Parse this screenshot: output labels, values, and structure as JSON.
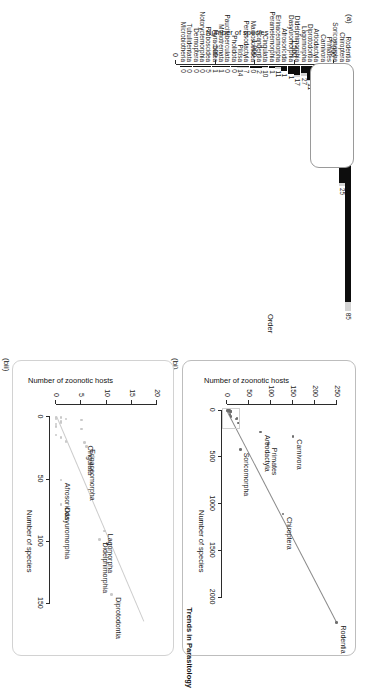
{
  "figure": {
    "journal_tag": "Trends in Parasitology",
    "panels": [
      {
        "tag": "(a)"
      },
      {
        "tag": "(bi)"
      },
      {
        "tag": "(bii)"
      }
    ]
  },
  "panel_a": {
    "tag": "(a)",
    "y_axis_title": "Number of species",
    "x_axis_title": "Order",
    "y_ticks": [
      "0",
      "500",
      "1,000",
      "1,500",
      "2,000"
    ]
  },
  "panel_bi": {
    "tag": "(bi)",
    "x_axis_title": "Number of species",
    "y_axis_title": "Number of zoonotic hosts",
    "x_ticks": [
      "0",
      "500",
      "1000",
      "1500",
      "2000"
    ],
    "y_ticks": [
      "0",
      "50",
      "100",
      "150",
      "200",
      "250"
    ]
  },
  "panel_bii": {
    "tag": "(bii)",
    "x_axis_title": "Number of species",
    "y_axis_title": "Number of zoonotic hosts",
    "x_ticks": [
      "0",
      "50",
      "100",
      "150"
    ],
    "y_ticks": [
      "0",
      "5",
      "10",
      "15",
      "20"
    ]
  },
  "chart_data": [
    {
      "type": "bar",
      "id": "panel-a",
      "title": "(a)",
      "xlabel": "Order",
      "ylabel": "Number of species",
      "ylim": [
        0,
        2200
      ],
      "grid": false,
      "orientation": "horizontal-stacked",
      "legend": null,
      "note": "Stacked bars: dark segment = non-zoonotic-host species, light segment = zoonotic host species. Light-segment counts shown as data labels.",
      "categories": [
        "Rodentia",
        "Chiroptera",
        "Soricomorpha",
        "Primates",
        "Carnivora",
        "Artiodactyla",
        "Diprotodontia",
        "Lagomorpha",
        "Didelphimorphia",
        "Dasyuromorphia",
        "Afrosoricida",
        "Erinaceomorpha",
        "Peramelemorphia",
        "Cingulata",
        "Scandentia",
        "Macroscelidea",
        "Perissodactyla",
        "Pilosa",
        "Pholidota",
        "Paucituberculata",
        "Monotremata",
        "Hyracoidea",
        "Proboscidea",
        "Notoryctemorphia",
        "Dermoptera",
        "Tubulidentata",
        "Microbiotheria"
      ],
      "series": [
        {
          "name": "Total species",
          "values": [
            2277,
            1116,
            428,
            376,
            286,
            240,
            143,
            92,
            99,
            71,
            51,
            24,
            21,
            21,
            20,
            15,
            17,
            10,
            8,
            6,
            5,
            4,
            3,
            2,
            2,
            1,
            1
          ]
        },
        {
          "name": "Zoonotic host species",
          "values": [
            85,
            25,
            21,
            61,
            83,
            52,
            11,
            27,
            17,
            1,
            1,
            11,
            1,
            10,
            2,
            0,
            7,
            14,
            0,
            0,
            1,
            1,
            5,
            0,
            0,
            0,
            0
          ]
        }
      ],
      "data_labels": [
        "85",
        "25",
        "21",
        "61",
        "83",
        "52",
        "11",
        "27",
        "17",
        "1",
        "1",
        "11",
        "1",
        "10",
        "2",
        "0",
        "7",
        "14",
        "0",
        "0",
        "1",
        "1",
        "5",
        "0",
        "0",
        "0",
        "0"
      ],
      "ytick_labels": [
        "0",
        "500",
        "1,000",
        "1,500",
        "2,000"
      ],
      "ytick_values": [
        0,
        500,
        1000,
        1500,
        2000
      ]
    },
    {
      "type": "scatter",
      "id": "panel-bi",
      "title": "(bi)",
      "xlabel": "Number of species",
      "ylabel": "Number of zoonotic hosts",
      "xlim": [
        -60,
        2400
      ],
      "ylim": [
        -12,
        262
      ],
      "grid": false,
      "xtick_values": [
        0,
        500,
        1000,
        1500,
        2000
      ],
      "ytick_values": [
        0,
        50,
        100,
        150,
        200,
        250
      ],
      "trend_line": {
        "type": "linear-fit",
        "x0": 0,
        "y0": 0,
        "x1": 2277,
        "y1": 252
      },
      "points": [
        {
          "label": "Rodentia",
          "x": 2277,
          "y": 250
        },
        {
          "label": "Chiroptera",
          "x": 1116,
          "y": 127
        },
        {
          "label": "Carnivora",
          "x": 286,
          "y": 150
        },
        {
          "label": "Primates",
          "x": 376,
          "y": 93
        },
        {
          "label": "Artiodactyla",
          "x": 240,
          "y": 76
        },
        {
          "label": "Soricomorpha",
          "x": 428,
          "y": 30
        },
        {
          "label": "",
          "x": 143,
          "y": 26
        },
        {
          "label": "",
          "x": 99,
          "y": 20
        },
        {
          "label": "",
          "x": 92,
          "y": 22
        },
        {
          "label": "",
          "x": 71,
          "y": 9
        },
        {
          "label": "",
          "x": 51,
          "y": 6
        },
        {
          "label": "",
          "x": 24,
          "y": 9
        },
        {
          "label": "",
          "x": 21,
          "y": 8
        },
        {
          "label": "",
          "x": 20,
          "y": 4
        },
        {
          "label": "",
          "x": 17,
          "y": 7
        },
        {
          "label": "",
          "x": 15,
          "y": 2
        },
        {
          "label": "",
          "x": 10,
          "y": 5
        },
        {
          "label": "",
          "x": 8,
          "y": 1
        },
        {
          "label": "",
          "x": 5,
          "y": 2
        },
        {
          "label": "",
          "x": 3,
          "y": 3
        }
      ],
      "inset_marker": "grey rectangle around the low-species cluster, expanded in panel (bii)"
    },
    {
      "type": "scatter",
      "id": "panel-bii",
      "title": "(bii)",
      "xlabel": "Number of species",
      "ylabel": "Number of zoonotic hosts",
      "xlim": [
        -10,
        175
      ],
      "ylim": [
        -1.2,
        21
      ],
      "grid": false,
      "xtick_values": [
        0,
        50,
        100,
        150
      ],
      "ytick_values": [
        0,
        5,
        10,
        15,
        20
      ],
      "trend_line": {
        "type": "linear-fit",
        "x0": 0,
        "y0": 0.2,
        "x1": 165,
        "y1": 17.5
      },
      "points": [
        {
          "label": "Diprotodontia",
          "x": 143,
          "y": 11
        },
        {
          "label": "Lagomorpha",
          "x": 92,
          "y": 9.6
        },
        {
          "label": "Didelphimorphia",
          "x": 99,
          "y": 8.6
        },
        {
          "label": "Dasyuromorphia",
          "x": 71,
          "y": 1
        },
        {
          "label": "Afrosoricida",
          "x": 51,
          "y": 1
        },
        {
          "label": "Erinaceomorpha",
          "x": 24,
          "y": 6
        },
        {
          "label": "Cingulata",
          "x": 21,
          "y": 5.6
        },
        {
          "label": "",
          "x": 20,
          "y": 2
        },
        {
          "label": "",
          "x": 17,
          "y": 1
        },
        {
          "label": "",
          "x": 15,
          "y": 0
        },
        {
          "label": "",
          "x": 10,
          "y": 5
        },
        {
          "label": "",
          "x": 8,
          "y": 0
        },
        {
          "label": "",
          "x": 6,
          "y": 0
        },
        {
          "label": "",
          "x": 5,
          "y": 1
        },
        {
          "label": "",
          "x": 4,
          "y": 1
        },
        {
          "label": "",
          "x": 3,
          "y": 5
        },
        {
          "label": "",
          "x": 2,
          "y": 0
        },
        {
          "label": "",
          "x": 2,
          "y": 2
        },
        {
          "label": "",
          "x": 1,
          "y": 0
        },
        {
          "label": "",
          "x": 1,
          "y": 1
        }
      ]
    }
  ]
}
